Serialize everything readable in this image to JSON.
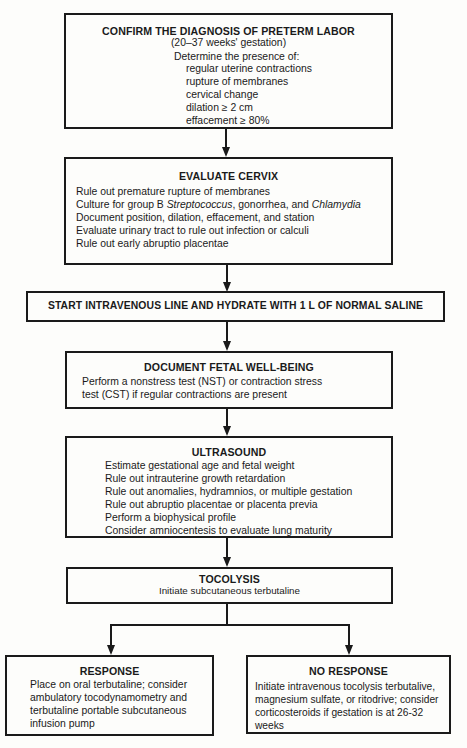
{
  "flowchart": {
    "confirm": {
      "title": "CONFIRM THE DIAGNOSIS OF PRETERM LABOR",
      "subtitle": "(20–37 weeks' gestation)",
      "intro": "Determine the presence of:",
      "items": [
        "regular uterine contractions",
        "rupture of membranes",
        "cervical change",
        "dilation ≥ 2 cm",
        "effacement ≥ 80%"
      ]
    },
    "cervix": {
      "title": "EVALUATE CERVIX",
      "items": [
        "Rule out premature rupture of membranes",
        "Culture for group B ",
        "Document position, dilation, effacement, and station",
        "Evaluate urinary tract to rule out infection or calculi",
        "Rule out early abruptio placentae"
      ],
      "culture_italic_1": "Streptococcus",
      "culture_mid": ", gonorrhea, and ",
      "culture_italic_2": "Chlamydia"
    },
    "iv": {
      "title": "START INTRAVENOUS LINE AND HYDRATE WITH 1 L OF NORMAL SALINE"
    },
    "fetal": {
      "title": "DOCUMENT FETAL WELL-BEING",
      "lines": [
        "Perform a nonstress test (NST) or contraction stress",
        "test (CST) if regular contractions are present"
      ]
    },
    "ultrasound": {
      "title": "ULTRASOUND",
      "items": [
        "Estimate gestational age and fetal weight",
        "Rule out intrauterine growth retardation",
        "Rule out anomalies, hydramnios, or multiple gestation",
        "Rule out abruptio placentae or placenta previa",
        "Perform a biophysical profile",
        "Consider amniocentesis to evaluate lung maturity"
      ]
    },
    "tocolysis": {
      "title": "TOCOLYSIS",
      "subtitle": "Initiate subcutaneous terbutaline"
    },
    "response": {
      "title": "RESPONSE",
      "lines": [
        "Place on oral terbutaline; consider",
        "ambulatory tocodynamometry and",
        "terbutaline portable subcutaneous",
        "infusion pump"
      ]
    },
    "no_response": {
      "title": "NO RESPONSE",
      "lines": [
        "Initiate intravenous tocolysis terbutalive,",
        "magnesium sulfate, or ritodrive; consider",
        "corticosteroids if gestation is at 26-32",
        "weeks"
      ]
    }
  },
  "colors": {
    "line": "#1a1a1a",
    "background": "#fdfdfb"
  }
}
